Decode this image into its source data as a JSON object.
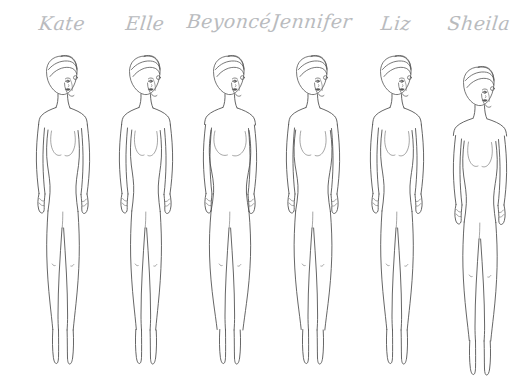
{
  "page": {
    "background_color": "#ffffff",
    "line_color": "#4a4a4a",
    "name_color": "#b9bbbe",
    "width": 531,
    "height": 386,
    "figure_count": 6
  },
  "figures": [
    {
      "name": "Kate",
      "slot_left": 17,
      "name_top": 14,
      "body_offset_y": 0,
      "icon": "female-croquis-icon",
      "silhouette": "slim-straight",
      "hip_width": 19,
      "bust_width": 16,
      "waist_width": 13,
      "shoulder_width": 22
    },
    {
      "name": "Elle",
      "slot_left": 100,
      "name_top": 14,
      "body_offset_y": 0,
      "icon": "female-croquis-icon",
      "silhouette": "slim-straight",
      "hip_width": 18,
      "bust_width": 15,
      "waist_width": 13,
      "shoulder_width": 22
    },
    {
      "name": "Beyoncé",
      "slot_left": 184,
      "name_top": 12,
      "body_offset_y": 0,
      "icon": "female-croquis-icon",
      "silhouette": "hourglass-curvy",
      "hip_width": 24,
      "bust_width": 21,
      "waist_width": 14,
      "shoulder_width": 23
    },
    {
      "name": "Jennifer",
      "slot_left": 267,
      "name_top": 12,
      "body_offset_y": 0,
      "icon": "female-croquis-icon",
      "silhouette": "pear-curvy",
      "hip_width": 22,
      "bust_width": 17,
      "waist_width": 13,
      "shoulder_width": 22
    },
    {
      "name": "Liz",
      "slot_left": 351,
      "name_top": 14,
      "body_offset_y": 0,
      "icon": "female-croquis-icon",
      "silhouette": "slim-straight",
      "hip_width": 19,
      "bust_width": 16,
      "waist_width": 13,
      "shoulder_width": 22
    },
    {
      "name": "Sheila",
      "slot_left": 434,
      "name_top": 14,
      "body_offset_y": 11,
      "icon": "female-croquis-icon",
      "silhouette": "slim-broad-shoulder",
      "hip_width": 20,
      "bust_width": 16,
      "waist_width": 14,
      "shoulder_width": 24
    }
  ]
}
